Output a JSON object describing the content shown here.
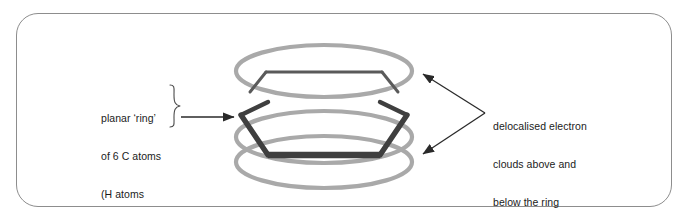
{
  "figure": {
    "frame": {
      "border_color": "#8d8d8d",
      "background": "#ffffff"
    },
    "annotations": {
      "left": {
        "name": "planar-ring-annotation",
        "lines": [
          "planar ‘ring’",
          "of 6 C atoms",
          "(H atoms",
          "not shown)"
        ],
        "brace": "}",
        "arrow": "right-arrow"
      },
      "right": {
        "name": "delocalised-electron-annotation",
        "lines": [
          "delocalised electron",
          "clouds above and",
          "below the ring"
        ],
        "arrows": [
          "arrow-to-upper-cloud",
          "arrow-to-lower-cloud"
        ]
      }
    },
    "shapes": {
      "carbon_ring": {
        "name": "carbon-hexagon-ring",
        "color": "#4a4a4a",
        "front_edge_color": "#3f3f3f",
        "back_edge_color": "#5a5a5a",
        "atom_count": 6,
        "element": "C"
      },
      "electron_clouds": [
        {
          "name": "upper-electron-cloud",
          "color": "#a9a9a9",
          "position": "above"
        },
        {
          "name": "lower-electron-cloud",
          "color": "#a9a9a9",
          "position": "below"
        }
      ]
    },
    "colors": {
      "frame_border": "#8d8d8d",
      "cloud": "#a9a9a9",
      "ring_dark": "#3f3f3f",
      "ring_light": "#5a5a5a",
      "text": "#1b1b1b",
      "arrow": "#2a2a2a"
    }
  }
}
